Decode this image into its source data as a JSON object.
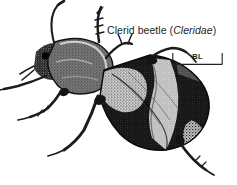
{
  "figure": {
    "caption_common_name": "Clerid beetle (",
    "caption_taxon": "Cleridae",
    "caption_close": ")",
    "caption_full": "Clerid beetle (Cleridae)",
    "background_color": "#ffffff",
    "ink_color": "#231f20"
  },
  "scale_bar": {
    "label": "BL",
    "meaning": "body length",
    "line_color": "#231f20"
  }
}
